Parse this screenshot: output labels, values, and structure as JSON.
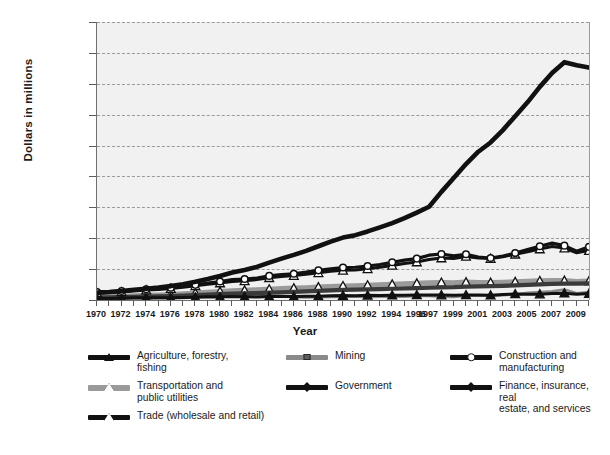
{
  "chart_data": {
    "type": "line",
    "title": "",
    "xlabel": "Year",
    "ylabel": "Dollars in millions",
    "grid": true,
    "legend_position": "bottom",
    "ylim": [
      0,
      1800000
    ],
    "ytick_values": [
      0,
      200000,
      400000,
      600000,
      800000,
      1000000,
      1200000,
      1400000,
      1600000,
      1800000
    ],
    "ytick_labels": [
      "0",
      "200,000",
      "400,000",
      "600,000",
      "800,000",
      "1,000,000",
      "1,200,000",
      "1,400,000",
      "1,600,000",
      "1,800,000"
    ],
    "xlim": [
      1970,
      2010
    ],
    "x": [
      1970,
      1971,
      1972,
      1973,
      1974,
      1975,
      1976,
      1977,
      1978,
      1979,
      1980,
      1981,
      1982,
      1983,
      1984,
      1985,
      1986,
      1987,
      1988,
      1989,
      1990,
      1991,
      1992,
      1993,
      1994,
      1995,
      1996,
      1997,
      1998,
      1999,
      2000,
      2001,
      2002,
      2003,
      2004,
      2005,
      2006,
      2007,
      2008,
      2009,
      2010
    ],
    "xtick_labels": [
      "1970",
      "1972",
      "1974",
      "1976",
      "1978",
      "1980",
      "1982",
      "1984",
      "1986",
      "1988",
      "1990",
      "1992",
      "1994",
      "1996",
      "1997",
      "1999",
      "2001",
      "2003",
      "2005",
      "2007",
      "2009"
    ],
    "xtick_positions": [
      1970,
      1972,
      1974,
      1976,
      1978,
      1980,
      1982,
      1984,
      1986,
      1988,
      1990,
      1992,
      1994,
      1996,
      1997,
      1999,
      2001,
      2003,
      2005,
      2007,
      2009
    ],
    "series": [
      {
        "name": "Finance, insurance, real estate, and services",
        "marker": "square-filled",
        "color": "#111111",
        "line_width": 4.6,
        "values": [
          48000,
          52000,
          58000,
          66000,
          73000,
          80000,
          90000,
          102000,
          118000,
          136000,
          156000,
          178000,
          194000,
          214000,
          242000,
          268000,
          292000,
          318000,
          348000,
          378000,
          404000,
          420000,
          444000,
          470000,
          498000,
          530000,
          566000,
          604000,
          700000,
          790000,
          880000,
          960000,
          1020000,
          1100000,
          1190000,
          1280000,
          1380000,
          1470000,
          1540000,
          1520000,
          1505000
        ]
      },
      {
        "name": "Construction and manufacturing",
        "marker": "circle-open",
        "color": "#111111",
        "line_width": 3.2,
        "values": [
          52000,
          54000,
          58000,
          64000,
          70000,
          74000,
          80000,
          88000,
          98000,
          110000,
          120000,
          132000,
          136000,
          142000,
          156000,
          164000,
          170000,
          180000,
          192000,
          202000,
          210000,
          212000,
          220000,
          230000,
          244000,
          258000,
          268000,
          290000,
          298000,
          286000,
          296000,
          278000,
          272000,
          284000,
          304000,
          326000,
          348000,
          368000,
          352000,
          316000,
          344000
        ]
      },
      {
        "name": "Trade (wholesale and retail)",
        "marker": "triangle-open",
        "color": "#111111",
        "line_width": 3.0,
        "values": [
          46000,
          48000,
          52000,
          58000,
          64000,
          68000,
          74000,
          82000,
          92000,
          102000,
          110000,
          120000,
          124000,
          132000,
          144000,
          152000,
          158000,
          166000,
          176000,
          186000,
          192000,
          194000,
          202000,
          212000,
          224000,
          236000,
          246000,
          262000,
          272000,
          268000,
          282000,
          272000,
          268000,
          280000,
          296000,
          312000,
          330000,
          346000,
          336000,
          306000,
          320000
        ]
      },
      {
        "name": "Transportation and public utilities",
        "marker": "triangle-open",
        "color": "#9a9a9a",
        "line_width": 5.0,
        "values": [
          22000,
          23000,
          25000,
          27000,
          30000,
          33000,
          36000,
          40000,
          45000,
          50000,
          55000,
          60000,
          63000,
          66000,
          70000,
          74000,
          77000,
          80000,
          84000,
          88000,
          91000,
          93000,
          96000,
          99000,
          102000,
          105000,
          108000,
          112000,
          114000,
          112000,
          116000,
          114000,
          113000,
          115000,
          118000,
          121000,
          124000,
          127000,
          126000,
          120000,
          123000
        ]
      },
      {
        "name": "Government",
        "marker": "square-filled",
        "color": "#3a3a3a",
        "line_width": 4.2,
        "values": [
          16000,
          17000,
          18000,
          20000,
          22000,
          24000,
          26000,
          29000,
          32000,
          35000,
          38000,
          41000,
          43000,
          45000,
          48000,
          50000,
          53000,
          56000,
          59000,
          62000,
          65000,
          67000,
          69000,
          71000,
          73000,
          75000,
          77000,
          80000,
          82000,
          83000,
          86000,
          88000,
          90000,
          92000,
          95000,
          98000,
          101000,
          104000,
          106000,
          106000,
          108000
        ]
      },
      {
        "name": "Agriculture, forestry, fishing",
        "marker": "triangle-filled",
        "color": "#111111",
        "line_width": 3.0,
        "values": [
          9000,
          9500,
          11000,
          14000,
          15000,
          14000,
          15000,
          16000,
          18000,
          21000,
          20000,
          22000,
          21000,
          19000,
          23000,
          22000,
          22000,
          24000,
          25000,
          28000,
          29000,
          28000,
          30000,
          29000,
          31000,
          30000,
          33000,
          33000,
          32000,
          31000,
          33000,
          32000,
          31000,
          35000,
          39000,
          38000,
          38000,
          42000,
          44000,
          38000,
          42000
        ]
      },
      {
        "name": "Mining",
        "marker": "square-filled",
        "color": "#8a8a8a",
        "line_width": 2.6,
        "values": [
          5000,
          5200,
          5600,
          6400,
          9000,
          11000,
          12000,
          14000,
          16000,
          22000,
          30000,
          36000,
          34000,
          28000,
          28000,
          26000,
          18000,
          17000,
          18000,
          19000,
          22000,
          21000,
          20000,
          21000,
          21000,
          22000,
          26000,
          27000,
          21000,
          20000,
          28000,
          30000,
          26000,
          31000,
          36000,
          46000,
          52000,
          56000,
          68000,
          44000,
          52000
        ]
      }
    ]
  },
  "legend": {
    "items": [
      {
        "label_line1": "Agriculture, forestry,",
        "label_line2": "fishing",
        "marker": "triangle-filled",
        "line_color": "#111111"
      },
      {
        "label_line1": "Transportation and",
        "label_line2": "public utilities",
        "marker": "triangle-open",
        "line_color": "#9a9a9a"
      },
      {
        "label_line1": "Trade (wholesale and retail)",
        "label_line2": "",
        "marker": "triangle-open",
        "line_color": "#111111"
      },
      {
        "label_line1": "Mining",
        "label_line2": "",
        "marker": "square-gray",
        "line_color": "#8a8a8a"
      },
      {
        "label_line1": "Government",
        "label_line2": "",
        "marker": "diamond-filled",
        "line_color": "#111111"
      },
      {
        "label_line1": "Construction and",
        "label_line2": "manufacturing",
        "marker": "circle-open",
        "line_color": "#111111"
      },
      {
        "label_line1": "Finance, insurance, real",
        "label_line2": "estate, and services",
        "marker": "diamond-filled",
        "line_color": "#111111"
      }
    ]
  },
  "colors": {
    "plot_background": "#f1f1f1",
    "gridline": "#9a9a9a",
    "axis": "#6f6f6f",
    "text": "#1a1a1a"
  }
}
